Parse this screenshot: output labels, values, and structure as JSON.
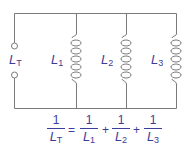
{
  "diagram": {
    "type": "parallel-inductor-circuit",
    "wire_color": "#7a7a7a",
    "label_color": "#3a3d9a",
    "total_label": {
      "base": "L",
      "sub": "T"
    },
    "inductors": [
      {
        "base": "L",
        "sub": "1"
      },
      {
        "base": "L",
        "sub": "2"
      },
      {
        "base": "L",
        "sub": "3"
      }
    ]
  },
  "formula": {
    "lhs": {
      "num": "1",
      "base": "L",
      "sub": "T"
    },
    "equals": "=",
    "plus": "+",
    "terms": [
      {
        "num": "1",
        "base": "L",
        "sub": "1"
      },
      {
        "num": "1",
        "base": "L",
        "sub": "2"
      },
      {
        "num": "1",
        "base": "L",
        "sub": "3"
      }
    ]
  }
}
